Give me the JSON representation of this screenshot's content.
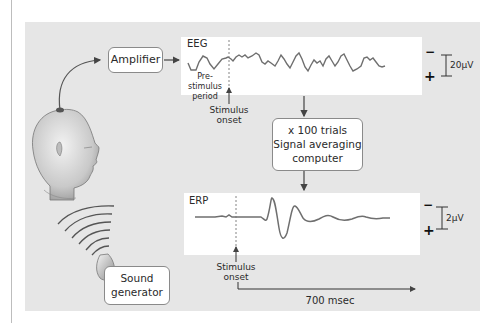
{
  "figure": {
    "amplifier_label": "Amplifier",
    "sound_generator_label": [
      "Sound",
      "generator"
    ],
    "averaging_box": {
      "line1": "x 100 trials",
      "line2": "Signal averaging",
      "line3": "computer"
    },
    "eeg_panel": {
      "title": "EEG",
      "prestimulus_label": [
        "Pre-stimulus",
        "period"
      ],
      "stimulus_label": [
        "Stimulus",
        "onset"
      ],
      "scale_label": "20µV",
      "minus_sign": "−",
      "plus_sign": "+"
    },
    "erp_panel": {
      "title": "ERP",
      "stimulus_label": [
        "Stimulus",
        "onset"
      ],
      "scale_label": "2µV",
      "minus_sign": "−",
      "plus_sign": "+"
    },
    "time_axis_label": "700 msec",
    "colors": {
      "panel_bg": "#e6e6e6",
      "trace": "#6f6f6f",
      "box_border": "#8a8a8a",
      "arrow": "#444444"
    }
  }
}
